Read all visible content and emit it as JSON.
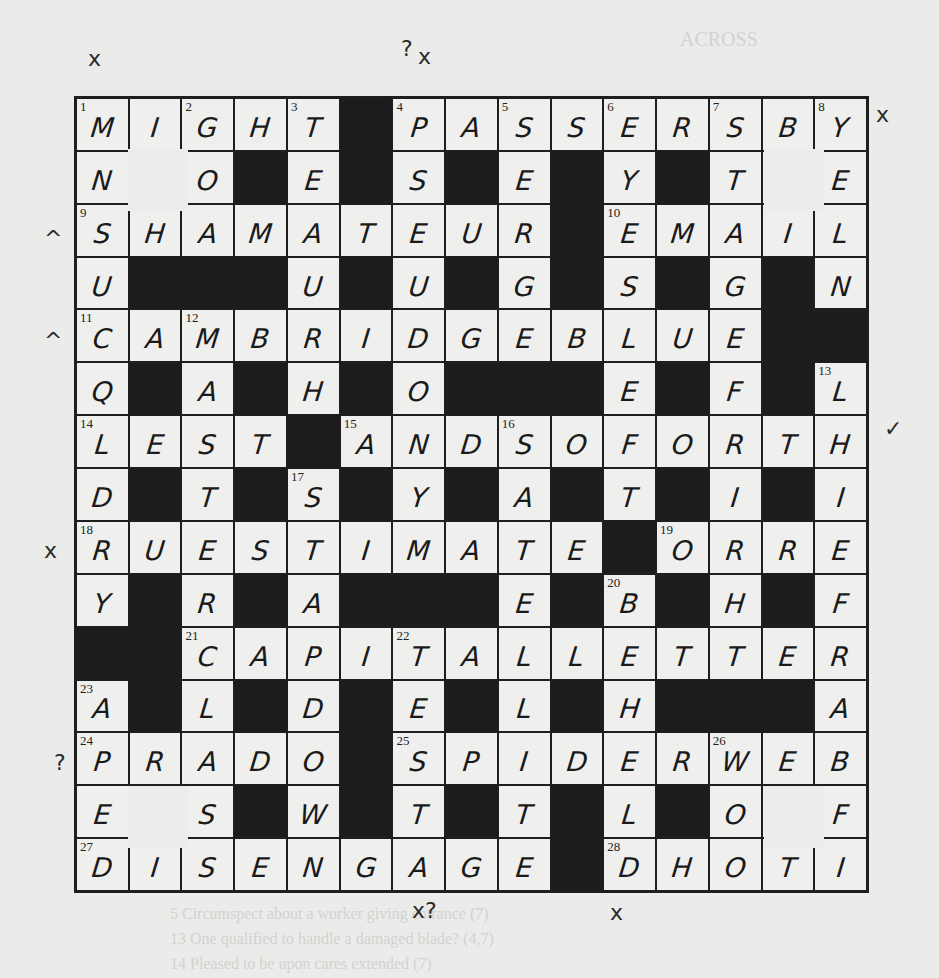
{
  "puzzle": {
    "type": "crossword",
    "size": 15,
    "bleed_through_text": {
      "heading": "ACROSS",
      "lines": [
        "5  Circumspect about a worker giving entrance (7)",
        "13  One qualified to handle a damaged blade? (4,7)",
        "14  Pleased to be upon cares extended (7)"
      ]
    },
    "grid": [
      [
        "M",
        "I",
        "G",
        "H",
        "T",
        "#",
        "P",
        "A",
        "S",
        "S",
        "E",
        "R",
        "S",
        "B",
        "Y"
      ],
      [
        "N",
        "",
        "O",
        "#",
        "E",
        "#",
        "S",
        "#",
        "E",
        "#",
        "Y",
        "#",
        "T",
        "",
        "E"
      ],
      [
        "S",
        "H",
        "A",
        "M",
        "A",
        "T",
        "E",
        "U",
        "R",
        "#",
        "E",
        "M",
        "A",
        "I",
        "L"
      ],
      [
        "U",
        "#",
        "#",
        "#",
        "U",
        "#",
        "U",
        "#",
        "G",
        "#",
        "S",
        "#",
        "G",
        "#",
        "N"
      ],
      [
        "C",
        "A",
        "M",
        "B",
        "R",
        "I",
        "D",
        "G",
        "E",
        "B",
        "L",
        "U",
        "E",
        "#",
        "#"
      ],
      [
        "Q",
        "#",
        "A",
        "#",
        "H",
        "#",
        "O",
        "#",
        "#",
        "#",
        "E",
        "#",
        "F",
        "#",
        "L"
      ],
      [
        "L",
        "E",
        "S",
        "T",
        "#",
        "A",
        "N",
        "D",
        "S",
        "O",
        "F",
        "O",
        "R",
        "T",
        "H"
      ],
      [
        "D",
        "#",
        "T",
        "#",
        "S",
        "#",
        "Y",
        "#",
        "A",
        "#",
        "T",
        "#",
        "I",
        "#",
        "I"
      ],
      [
        "R",
        "U",
        "E",
        "S",
        "T",
        "I",
        "M",
        "A",
        "T",
        "E",
        "#",
        "O",
        "R",
        "R",
        "E"
      ],
      [
        "Y",
        "#",
        "R",
        "#",
        "A",
        "#",
        "#",
        "#",
        "E",
        "#",
        "B",
        "#",
        "H",
        "#",
        "F"
      ],
      [
        "#",
        "#",
        "C",
        "A",
        "P",
        "I",
        "T",
        "A",
        "L",
        "L",
        "E",
        "T",
        "T",
        "E",
        "R"
      ],
      [
        "A",
        "#",
        "L",
        "#",
        "D",
        "#",
        "E",
        "#",
        "L",
        "#",
        "H",
        "#",
        "#",
        "#",
        "A"
      ],
      [
        "P",
        "R",
        "A",
        "D",
        "O",
        "#",
        "S",
        "P",
        "I",
        "D",
        "E",
        "R",
        "W",
        "E",
        "B"
      ],
      [
        "E",
        "",
        "S",
        "#",
        "W",
        "#",
        "T",
        "#",
        "T",
        "#",
        "L",
        "#",
        "O",
        "",
        "F"
      ],
      [
        "D",
        "I",
        "S",
        "E",
        "N",
        "G",
        "A",
        "G",
        "E",
        "#",
        "D",
        "H",
        "O",
        "T",
        "I"
      ]
    ],
    "numbers": [
      {
        "n": "1",
        "r": 0,
        "c": 0
      },
      {
        "n": "2",
        "r": 0,
        "c": 2
      },
      {
        "n": "3",
        "r": 0,
        "c": 4
      },
      {
        "n": "4",
        "r": 0,
        "c": 6
      },
      {
        "n": "5",
        "r": 0,
        "c": 8
      },
      {
        "n": "6",
        "r": 0,
        "c": 10
      },
      {
        "n": "7",
        "r": 0,
        "c": 12
      },
      {
        "n": "8",
        "r": 0,
        "c": 14
      },
      {
        "n": "9",
        "r": 2,
        "c": 0
      },
      {
        "n": "10",
        "r": 2,
        "c": 10
      },
      {
        "n": "11",
        "r": 4,
        "c": 0
      },
      {
        "n": "12",
        "r": 4,
        "c": 2
      },
      {
        "n": "13",
        "r": 5,
        "c": 14
      },
      {
        "n": "14",
        "r": 6,
        "c": 0
      },
      {
        "n": "15",
        "r": 6,
        "c": 5
      },
      {
        "n": "16",
        "r": 6,
        "c": 8
      },
      {
        "n": "17",
        "r": 7,
        "c": 4
      },
      {
        "n": "18",
        "r": 8,
        "c": 0
      },
      {
        "n": "19",
        "r": 8,
        "c": 11
      },
      {
        "n": "20",
        "r": 9,
        "c": 10
      },
      {
        "n": "21",
        "r": 10,
        "c": 2
      },
      {
        "n": "22",
        "r": 10,
        "c": 6
      },
      {
        "n": "23",
        "r": 11,
        "c": 0
      },
      {
        "n": "24",
        "r": 12,
        "c": 0
      },
      {
        "n": "25",
        "r": 12,
        "c": 6
      },
      {
        "n": "26",
        "r": 12,
        "c": 12
      },
      {
        "n": "27",
        "r": 14,
        "c": 0
      },
      {
        "n": "28",
        "r": 14,
        "c": 10
      }
    ],
    "erased_patches": [
      {
        "left": 128,
        "top": 149
      },
      {
        "left": 764,
        "top": 149
      },
      {
        "left": 128,
        "top": 786
      },
      {
        "left": 764,
        "top": 786
      }
    ],
    "margin_marks": [
      {
        "text": "x",
        "left": 88,
        "top": 48
      },
      {
        "text": "?",
        "left": 401,
        "top": 38
      },
      {
        "text": "x",
        "left": 418,
        "top": 46
      },
      {
        "text": "x",
        "left": 876,
        "top": 104
      },
      {
        "text": "^",
        "left": 44,
        "top": 228
      },
      {
        "text": "^",
        "left": 44,
        "top": 330
      },
      {
        "text": "✓",
        "left": 884,
        "top": 418
      },
      {
        "text": "x",
        "left": 44,
        "top": 540
      },
      {
        "text": "?",
        "left": 54,
        "top": 752
      },
      {
        "text": "x?",
        "left": 412,
        "top": 900
      },
      {
        "text": "x",
        "left": 610,
        "top": 902
      }
    ]
  }
}
